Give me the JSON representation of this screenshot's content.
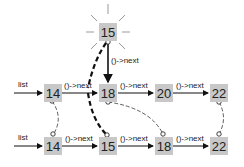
{
  "diagram": {
    "new_node": {
      "value": "15",
      "x": 99,
      "y": 23
    },
    "new_node_label": "()->next",
    "top_row": {
      "list_label": "list",
      "nodes": [
        {
          "value": "14",
          "x": 44,
          "y": 84
        },
        {
          "value": "18",
          "x": 99,
          "y": 84
        },
        {
          "value": "20",
          "x": 155,
          "y": 84
        },
        {
          "value": "22",
          "x": 210,
          "y": 84
        }
      ],
      "edge_labels": [
        "()->next",
        "()->next",
        "()->next"
      ]
    },
    "bottom_row": {
      "list_label": "list",
      "nodes": [
        {
          "value": "14",
          "x": 44,
          "y": 137
        },
        {
          "value": "15",
          "x": 99,
          "y": 137
        },
        {
          "value": "18",
          "x": 155,
          "y": 137
        },
        {
          "value": "22",
          "x": 210,
          "y": 137
        }
      ],
      "edge_labels": [
        "()->next",
        "()->next",
        "()->next"
      ]
    },
    "colors": {
      "node_fill": "#c8c8c8",
      "line": "#111111"
    }
  }
}
